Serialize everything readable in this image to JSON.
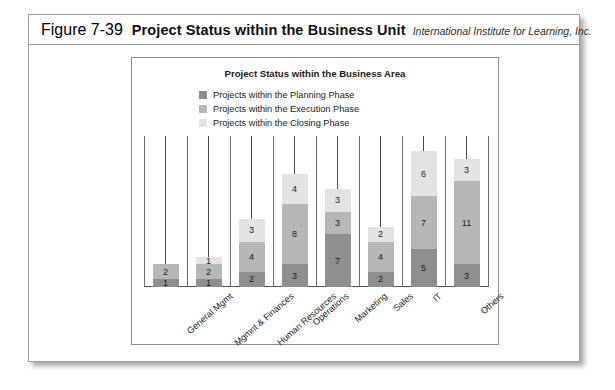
{
  "caption": {
    "figure_number": "Figure 7-39",
    "title": "Project Status within the Business Unit",
    "source": "International Institute for Learning, Inc."
  },
  "chart_data": {
    "type": "bar",
    "subtype": "stacked-column",
    "title": "Project Status within the Business Area",
    "xlabel": "",
    "ylabel": "",
    "grid": true,
    "legend_position": "top-center",
    "ylim": [
      0,
      20
    ],
    "categories": [
      "General Mgmt",
      "Mgmnt & Finances",
      "Human Resources",
      "Operations",
      "Marketing",
      "Sales",
      "IT",
      "Others"
    ],
    "series": [
      {
        "name": "Projects within the Planning Phase",
        "color": "#8f8f8f",
        "values": [
          1,
          1,
          2,
          3,
          7,
          2,
          5,
          3
        ]
      },
      {
        "name": "Projects within the Execution Phase",
        "color": "#b7b7b7",
        "values": [
          2,
          2,
          4,
          8,
          3,
          4,
          7,
          11
        ]
      },
      {
        "name": "Projects within the Closing Phase",
        "color": "#e3e3e3",
        "values": [
          0,
          1,
          3,
          4,
          3,
          2,
          6,
          3
        ]
      }
    ],
    "totals": [
      3,
      4,
      9,
      15,
      13,
      8,
      18,
      17
    ]
  },
  "colors": {
    "planning": "#8f8f8f",
    "execution": "#b7b7b7",
    "closing": "#e3e3e3",
    "frame": "#8d8d8d",
    "gridline": "#6b6b6b",
    "text": "#1a1a1a"
  }
}
